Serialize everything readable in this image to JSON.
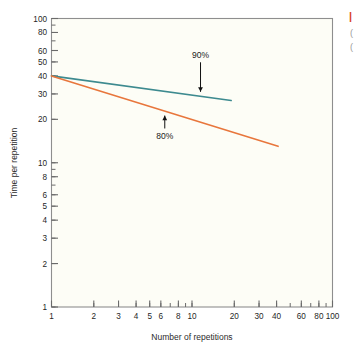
{
  "chart_data": {
    "type": "line",
    "title": "",
    "xlabel": "Number of repetitions",
    "ylabel": "Time per repetition",
    "xscale": "log",
    "yscale": "log",
    "xlim": [
      1,
      100
    ],
    "ylim": [
      1,
      100
    ],
    "grid": false,
    "legend": "none",
    "xticks": [
      1,
      2,
      3,
      4,
      5,
      6,
      8,
      10,
      20,
      30,
      40,
      60,
      80,
      100
    ],
    "xtick_labels": [
      "1",
      "2",
      "3",
      "4",
      "5",
      "6",
      "8",
      "10",
      "20",
      "30",
      "40",
      "60",
      "80",
      "100"
    ],
    "yticks": [
      1,
      2,
      3,
      4,
      5,
      6,
      8,
      10,
      20,
      30,
      40,
      50,
      60,
      80,
      100
    ],
    "ytick_labels": [
      "1",
      "2",
      "3",
      "4",
      "5",
      "6",
      "8",
      "10",
      "20",
      "30",
      "40",
      "50",
      "60",
      "80",
      "100"
    ],
    "series": [
      {
        "name": "90%",
        "color": "#3d8a8f",
        "x": [
          1,
          19
        ],
        "values": [
          40,
          27
        ]
      },
      {
        "name": "80%",
        "color": "#e8763c",
        "x": [
          1,
          41
        ],
        "values": [
          40,
          13
        ]
      }
    ],
    "annotations": [
      {
        "text": "90%",
        "series": "90%",
        "arrow": "down",
        "x": 11.5,
        "y": 53
      },
      {
        "text": "80%",
        "series": "80%",
        "arrow": "up",
        "x": 6.4,
        "y": 14.5
      }
    ]
  },
  "colors": {
    "series_90": "#3d8a8f",
    "series_80": "#e8763c",
    "plot_background": "#fdfdf6",
    "frame": "#8e8e8e",
    "text": "#1f1f1f",
    "edge_accent": "#d8452a"
  },
  "edge_text": {
    "fragment_1": "|",
    "fragment_2": "(",
    "fragment_3": "("
  }
}
